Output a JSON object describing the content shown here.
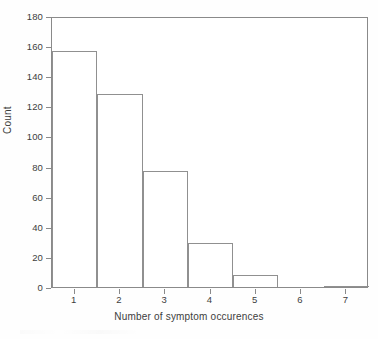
{
  "chart_data": {
    "type": "bar",
    "title": "",
    "subtitle": "",
    "xlabel": "Number of symptom occurences",
    "ylabel": "Count",
    "categories": [
      "1",
      "2",
      "3",
      "4",
      "5",
      "6",
      "7"
    ],
    "values": [
      157,
      128,
      77,
      29,
      8,
      0,
      1
    ],
    "series": [
      {
        "name": "Count",
        "values": [
          157,
          128,
          77,
          29,
          8,
          0,
          1
        ]
      }
    ],
    "xlim": [
      0.5,
      7.5
    ],
    "ylim": [
      0,
      180
    ],
    "y_ticks": [
      0,
      20,
      40,
      60,
      80,
      100,
      120,
      140,
      160,
      180
    ],
    "y_tick_labels": [
      "0",
      "20",
      "40",
      "60",
      "80",
      "100",
      "120",
      "140",
      "160",
      "180"
    ],
    "x_ticks": [
      1,
      2,
      3,
      4,
      5,
      6,
      7
    ],
    "x_tick_labels": [
      "1",
      "2",
      "3",
      "4",
      "5",
      "6",
      "7"
    ],
    "grid": false,
    "legend": false,
    "legend_position": "none",
    "bin_width": 1,
    "bar_style": {
      "fill": "#ffffff",
      "edge": "#909090",
      "edge_width": 1
    },
    "frame": {
      "style": "full-box",
      "color": "#8a8a8a"
    },
    "annotations": []
  },
  "figure": {
    "background": "#fefefe",
    "text_color": "#3d3d3d"
  }
}
